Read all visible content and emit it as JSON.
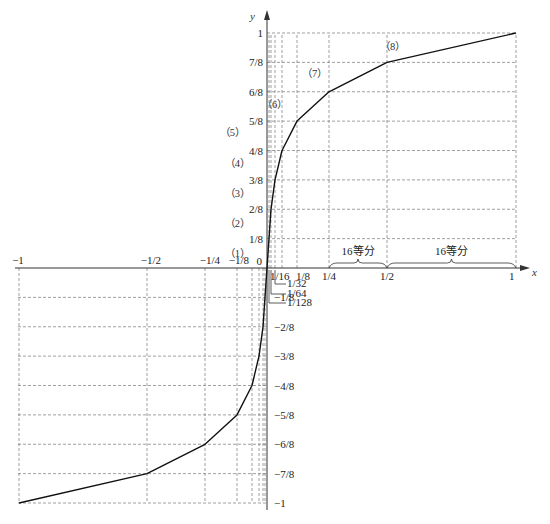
{
  "chart_data": {
    "type": "line",
    "title": "",
    "xlabel": "x",
    "ylabel": "y",
    "xlim": [
      -1,
      1
    ],
    "ylim": [
      -1,
      1
    ],
    "grid": true,
    "legend": null,
    "series": [
      {
        "name": "13-segment compression curve",
        "x": [
          -1,
          -0.5,
          -0.25,
          -0.125,
          -0.0625,
          -0.03125,
          -0.015625,
          -0.0078125,
          0,
          0.0078125,
          0.015625,
          0.03125,
          0.0625,
          0.125,
          0.25,
          0.5,
          1
        ],
        "y": [
          -1,
          -0.875,
          -0.75,
          -0.625,
          -0.5,
          -0.375,
          -0.25,
          -0.125,
          0,
          0.125,
          0.25,
          0.375,
          0.5,
          0.625,
          0.75,
          0.875,
          1
        ]
      }
    ],
    "x_tick_labels_positive": [
      "1/16",
      "1/8",
      "1/4",
      "1/2",
      "1"
    ],
    "x_tick_labels_small": [
      "1/32",
      "1/64",
      "1/128"
    ],
    "x_tick_labels_negative": [
      "-1",
      "-1/2",
      "-1/4",
      "-1/8"
    ],
    "y_tick_labels_positive": [
      "1/8",
      "2/8",
      "3/8",
      "4/8",
      "5/8",
      "6/8",
      "7/8",
      "1"
    ],
    "y_tick_labels_negative": [
      "-1/8",
      "-2/8",
      "-3/8",
      "-4/8",
      "-5/8",
      "-6/8",
      "-7/8",
      "-1"
    ],
    "origin_label": "0",
    "segment_labels": [
      "(1)",
      "(2)",
      "(3)",
      "(4)",
      "(5)",
      "(6)",
      "(7)",
      "(8)"
    ],
    "annotations": [
      "16等分",
      "16等分"
    ]
  }
}
